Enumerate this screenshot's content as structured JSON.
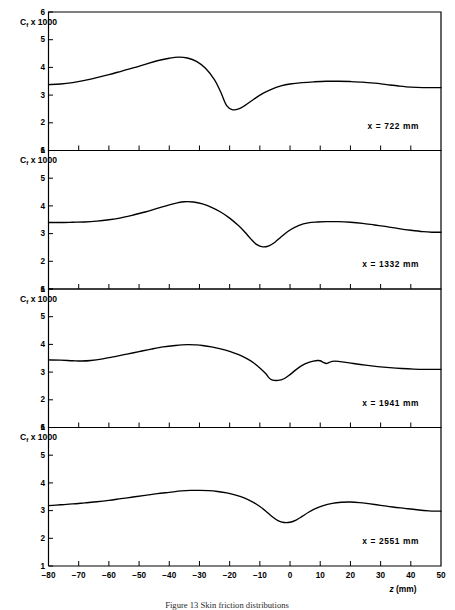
{
  "figure": {
    "caption": "Figure 13   Skin friction distributions",
    "y_axis_label_main": "C",
    "y_axis_label_subscript": "f",
    "y_axis_label_rest": " x 1000",
    "x_axis_title_symbol": "z",
    "x_axis_title_unit": "(mm)",
    "annotation_prefix": "x  =  ",
    "annotation_unit": " mm"
  },
  "chart_data": {
    "type": "line",
    "title": "Figure 13   Skin friction distributions",
    "xlabel": "z (mm)",
    "ylabel": "Cf x 1000",
    "xlim": [
      -80,
      50
    ],
    "ylim": [
      1,
      6
    ],
    "xticks": [
      -80,
      -70,
      -60,
      -50,
      -40,
      -30,
      -20,
      -10,
      0,
      10,
      20,
      30,
      40,
      50
    ],
    "xtick_labels": [
      "−80",
      "−70",
      "−60",
      "−50",
      "−40",
      "−30",
      "−20",
      "−10",
      "0",
      "10",
      "20",
      "30",
      "40",
      "50"
    ],
    "yticks": [
      1,
      2,
      3,
      4,
      5,
      6
    ],
    "ytick_labels": [
      "1",
      "2",
      "3",
      "4",
      "5",
      "6"
    ],
    "grid": false,
    "legend_position": "none",
    "panel_count": 4,
    "panels": [
      {
        "label": "x  =  722 mm",
        "station_x_mm": 722,
        "annotation_value": "722",
        "peak_value": 4.37,
        "peak_z": -37,
        "min_value": 2.47,
        "min_z": -21,
        "x": [
          -80,
          -76,
          -72,
          -68,
          -64,
          -60,
          -56,
          -52,
          -48,
          -44,
          -40,
          -37,
          -34,
          -31,
          -28,
          -25,
          -23,
          -21,
          -19,
          -17,
          -15,
          -12,
          -9,
          -6,
          -3,
          0,
          4,
          8,
          12,
          16,
          20,
          24,
          28,
          32,
          36,
          40,
          44,
          47,
          50
        ],
        "y": [
          3.38,
          3.4,
          3.45,
          3.53,
          3.63,
          3.74,
          3.86,
          3.98,
          4.11,
          4.24,
          4.33,
          4.37,
          4.34,
          4.22,
          3.97,
          3.55,
          3.12,
          2.62,
          2.47,
          2.5,
          2.62,
          2.85,
          3.06,
          3.22,
          3.33,
          3.4,
          3.45,
          3.48,
          3.5,
          3.5,
          3.49,
          3.47,
          3.43,
          3.38,
          3.33,
          3.29,
          3.27,
          3.27,
          3.27
        ]
      },
      {
        "label": "x  =  1332 mm",
        "station_x_mm": 1332,
        "annotation_value": "1332",
        "peak_value": 4.15,
        "peak_z": -35,
        "min_value": 2.52,
        "min_z": -12,
        "x": [
          -80,
          -76,
          -72,
          -68,
          -64,
          -60,
          -56,
          -52,
          -48,
          -44,
          -40,
          -37,
          -35,
          -32,
          -29,
          -26,
          -23,
          -20,
          -17,
          -15,
          -13,
          -11,
          -9,
          -7,
          -5,
          -3,
          0,
          3,
          6,
          9,
          12,
          16,
          20,
          24,
          28,
          32,
          36,
          40,
          44,
          47,
          50
        ],
        "y": [
          3.4,
          3.4,
          3.41,
          3.42,
          3.45,
          3.5,
          3.57,
          3.67,
          3.78,
          3.91,
          4.04,
          4.12,
          4.15,
          4.14,
          4.07,
          3.95,
          3.78,
          3.56,
          3.28,
          3.06,
          2.81,
          2.6,
          2.52,
          2.56,
          2.69,
          2.88,
          3.13,
          3.3,
          3.39,
          3.42,
          3.43,
          3.43,
          3.41,
          3.37,
          3.31,
          3.25,
          3.18,
          3.12,
          3.07,
          3.05,
          3.05
        ]
      },
      {
        "label": "x  =  1941 mm",
        "station_x_mm": 1941,
        "annotation_value": "1941",
        "peak_value": 3.99,
        "peak_z": -30,
        "min_value": 2.7,
        "min_z": -7,
        "secondary_bump_z": 13,
        "secondary_bump_value": 3.4,
        "x": [
          -80,
          -76,
          -72,
          -69,
          -66,
          -62,
          -58,
          -54,
          -50,
          -46,
          -42,
          -38,
          -34,
          -31,
          -29,
          -26,
          -23,
          -20,
          -17,
          -14,
          -12,
          -10,
          -8,
          -7,
          -6,
          -4,
          -2,
          0,
          2,
          4,
          6,
          8,
          9,
          10,
          11,
          12,
          13,
          14,
          16,
          18,
          21,
          25,
          29,
          33,
          37,
          41,
          45,
          48,
          50
        ],
        "y": [
          3.44,
          3.43,
          3.41,
          3.4,
          3.42,
          3.48,
          3.56,
          3.65,
          3.74,
          3.83,
          3.91,
          3.96,
          3.99,
          3.98,
          3.96,
          3.91,
          3.84,
          3.75,
          3.63,
          3.47,
          3.33,
          3.15,
          2.94,
          2.8,
          2.72,
          2.7,
          2.76,
          2.91,
          3.09,
          3.24,
          3.34,
          3.4,
          3.42,
          3.41,
          3.35,
          3.31,
          3.35,
          3.39,
          3.39,
          3.36,
          3.31,
          3.25,
          3.2,
          3.16,
          3.13,
          3.11,
          3.1,
          3.1,
          3.1
        ]
      },
      {
        "label": "x  =  2551 mm",
        "station_x_mm": 2551,
        "annotation_value": "2551",
        "peak_value": 3.73,
        "peak_z": -30,
        "min_value": 2.57,
        "min_z": -2,
        "secondary_bump_z": 20,
        "secondary_bump_value": 3.3,
        "x": [
          -80,
          -76,
          -72,
          -68,
          -64,
          -60,
          -56,
          -52,
          -48,
          -44,
          -40,
          -36,
          -33,
          -30,
          -27,
          -24,
          -21,
          -18,
          -15,
          -12,
          -10,
          -8,
          -6,
          -4,
          -2,
          0,
          2,
          4,
          6,
          8,
          11,
          14,
          17,
          20,
          23,
          26,
          30,
          34,
          38,
          42,
          46,
          48,
          50
        ],
        "y": [
          3.18,
          3.21,
          3.24,
          3.28,
          3.32,
          3.37,
          3.43,
          3.49,
          3.55,
          3.61,
          3.66,
          3.71,
          3.73,
          3.73,
          3.72,
          3.69,
          3.64,
          3.56,
          3.45,
          3.29,
          3.15,
          2.98,
          2.79,
          2.64,
          2.57,
          2.58,
          2.66,
          2.79,
          2.93,
          3.05,
          3.18,
          3.26,
          3.3,
          3.31,
          3.29,
          3.25,
          3.19,
          3.13,
          3.08,
          3.03,
          2.99,
          2.98,
          2.98
        ]
      }
    ]
  }
}
